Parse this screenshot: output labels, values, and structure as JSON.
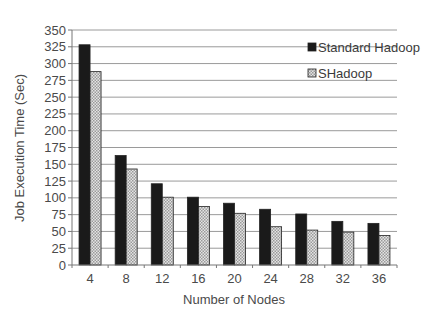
{
  "chart_data": {
    "type": "bar",
    "title": "",
    "xlabel": "Number of Nodes",
    "ylabel": "Job Execution Time (Sec)",
    "categories": [
      "4",
      "8",
      "12",
      "16",
      "20",
      "24",
      "28",
      "32",
      "36"
    ],
    "series": [
      {
        "name": "Standard Hadoop",
        "values": [
          328,
          163,
          121,
          101,
          92,
          83,
          76,
          65,
          62
        ],
        "color": "#1a1a1a",
        "pattern": "solid"
      },
      {
        "name": "SHadoop",
        "values": [
          288,
          143,
          101,
          87,
          77,
          57,
          52,
          49,
          44
        ],
        "color": "#c8c8c8",
        "pattern": "checker"
      }
    ],
    "ylim": [
      0,
      350
    ],
    "yticks": [
      0,
      25,
      50,
      75,
      100,
      125,
      150,
      175,
      200,
      225,
      250,
      275,
      300,
      325,
      350
    ],
    "grid": true,
    "legend_position": "upper-right-inside"
  }
}
